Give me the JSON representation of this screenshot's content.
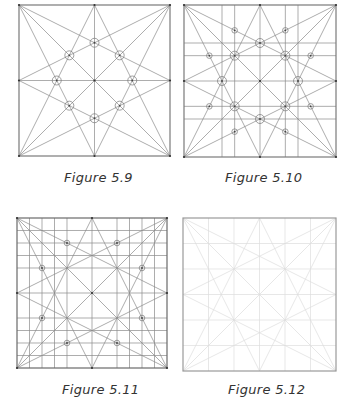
{
  "figures": [
    {
      "id": "5.9",
      "caption": "Figure 5.9",
      "box": {
        "x": 19,
        "y": 5,
        "size": 151
      },
      "caption_pos": {
        "x": 64,
        "y": 170
      },
      "grid": [],
      "circles": [
        [
          0.5,
          0.25
        ],
        [
          0.25,
          0.5
        ],
        [
          0.75,
          0.5
        ],
        [
          0.5,
          0.75
        ],
        [
          0.3333,
          0.3333
        ],
        [
          0.6667,
          0.3333
        ],
        [
          0.3333,
          0.6667
        ],
        [
          0.6667,
          0.6667
        ]
      ],
      "small_circles": [],
      "stroke": "#8a8a8a",
      "border": "#7a7a7a"
    },
    {
      "id": "5.10",
      "caption": "Figure 5.10",
      "box": {
        "x": 184,
        "y": 5,
        "size": 152
      },
      "caption_pos": {
        "x": 225,
        "y": 170
      },
      "grid": [
        0.25,
        0.3333,
        0.6667,
        0.75
      ],
      "circles": [
        [
          0.5,
          0.25
        ],
        [
          0.25,
          0.5
        ],
        [
          0.75,
          0.5
        ],
        [
          0.5,
          0.75
        ],
        [
          0.3333,
          0.3333
        ],
        [
          0.6667,
          0.3333
        ],
        [
          0.3333,
          0.6667
        ],
        [
          0.6667,
          0.6667
        ]
      ],
      "small_circles": [
        [
          0.3333,
          0.1667
        ],
        [
          0.6667,
          0.1667
        ],
        [
          0.1667,
          0.3333
        ],
        [
          0.8333,
          0.3333
        ],
        [
          0.1667,
          0.6667
        ],
        [
          0.8333,
          0.6667
        ],
        [
          0.3333,
          0.8333
        ],
        [
          0.6667,
          0.8333
        ]
      ],
      "stroke": "#8a8a8a",
      "border": "#7a7a7a"
    },
    {
      "id": "5.11",
      "caption": "Figure 5.11",
      "box": {
        "x": 17,
        "y": 218,
        "size": 150
      },
      "caption_pos": {
        "x": 62,
        "y": 382
      },
      "grid": [
        0.0833,
        0.1667,
        0.25,
        0.3333,
        0.6667,
        0.75,
        0.8333,
        0.9167
      ],
      "circles": [],
      "small_circles": [
        [
          0.3333,
          0.1667
        ],
        [
          0.6667,
          0.1667
        ],
        [
          0.1667,
          0.3333
        ],
        [
          0.8333,
          0.3333
        ],
        [
          0.1667,
          0.6667
        ],
        [
          0.8333,
          0.6667
        ],
        [
          0.3333,
          0.8333
        ],
        [
          0.6667,
          0.8333
        ]
      ],
      "stroke": "#8a8a8a",
      "border": "#6a6a6a"
    },
    {
      "id": "5.12",
      "caption": "Figure 5.12",
      "box": {
        "x": 183,
        "y": 218,
        "size": 153
      },
      "caption_pos": {
        "x": 228,
        "y": 382
      },
      "grid": [
        0.1667,
        0.3333,
        0.6667,
        0.8333
      ],
      "circles": [],
      "small_circles": [],
      "stroke": "#dcdcdc",
      "border": "#9a9a9a"
    }
  ]
}
